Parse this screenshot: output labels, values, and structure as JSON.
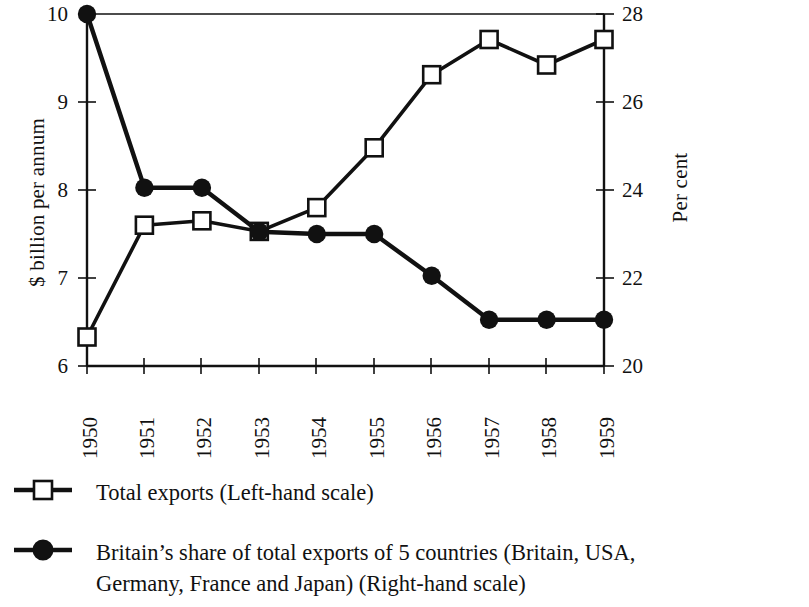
{
  "chart_data": {
    "type": "line",
    "title": "",
    "subtitle": "",
    "xlabel": "",
    "ylabel": "$ billion per annum",
    "y2label": "Per cent",
    "categories": [
      "1950",
      "1951",
      "1952",
      "1953",
      "1954",
      "1955",
      "1956",
      "1957",
      "1958",
      "1959"
    ],
    "x": [
      1950,
      1951,
      1952,
      1953,
      1954,
      1955,
      1956,
      1957,
      1958,
      1959
    ],
    "ylim": [
      6,
      10
    ],
    "y2lim": [
      20,
      28
    ],
    "yticks": [
      "6",
      "7",
      "8",
      "9",
      "10"
    ],
    "y2ticks": [
      "20",
      "22",
      "24",
      "26",
      "28"
    ],
    "grid": false,
    "legend_position": "below",
    "series": [
      {
        "name": "Total exports (Left-hand scale)",
        "axis": "left",
        "marker": "open-square",
        "values": [
          6.33,
          7.6,
          7.65,
          7.53,
          7.8,
          8.48,
          9.31,
          9.71,
          9.42,
          9.71
        ]
      },
      {
        "name": "Britain's share of total exports of 5 countries (Britain, USA, Germany, France and Japan) (Right-hand scale)",
        "axis": "right",
        "marker": "filled-circle",
        "values": [
          28.0,
          24.05,
          24.05,
          23.05,
          23.0,
          23.0,
          22.05,
          21.05,
          21.05,
          21.05
        ]
      }
    ]
  },
  "legend": {
    "items": [
      {
        "marker": "open-square-marker",
        "label": "Total exports (Left-hand scale)",
        "label_line2": ""
      },
      {
        "marker": "filled-circle-marker",
        "label": "Britain’s share of total exports of 5 countries (Britain, USA,",
        "label_line2": "Germany, France and Japan) (Right-hand scale)"
      }
    ]
  },
  "axes": {
    "left_title": "$ billion per annum",
    "right_title": "Per cent",
    "left_ticks": [
      "10",
      "9",
      "8",
      "7",
      "6"
    ],
    "right_ticks": [
      "28",
      "26",
      "24",
      "22",
      "20"
    ],
    "x_ticks": [
      "1950",
      "1951",
      "1952",
      "1953",
      "1954",
      "1955",
      "1956",
      "1957",
      "1958",
      "1959"
    ]
  },
  "colors": {
    "ink": "#111111",
    "background": "#ffffff",
    "series_open": "#ffffff",
    "series_filled": "#111111"
  }
}
